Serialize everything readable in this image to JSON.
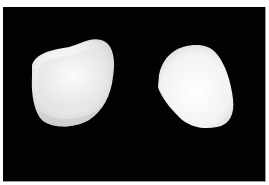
{
  "image": {
    "description": "Two white ceramic dental crowns on black background",
    "background_color": "#020202",
    "border_color": "#ffffff",
    "objects": [
      {
        "name": "left-crown",
        "view": "inner/occlusal opening view",
        "color": "#f2f2f2"
      },
      {
        "name": "right-crown",
        "view": "outer surface view",
        "color": "#fafafa"
      }
    ]
  }
}
